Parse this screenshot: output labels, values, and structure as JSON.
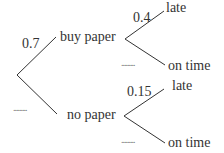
{
  "diagram": {
    "type": "probability-tree",
    "colors": {
      "line": "#333333",
      "text": "#333333",
      "blank": "#777777"
    },
    "stage1": {
      "branches": [
        {
          "outcome": "buy paper",
          "probability": "0.7"
        },
        {
          "outcome": "no paper",
          "probability": "........."
        }
      ]
    },
    "stage2": {
      "buy_paper": {
        "branches": [
          {
            "outcome": "late",
            "probability": "0.4"
          },
          {
            "outcome": "on time",
            "probability": "........."
          }
        ]
      },
      "no_paper": {
        "branches": [
          {
            "outcome": "late",
            "probability": "0.15"
          },
          {
            "outcome": "on time",
            "probability": "........."
          }
        ]
      }
    }
  }
}
